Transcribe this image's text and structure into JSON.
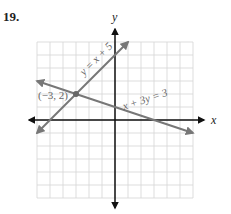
{
  "problem": {
    "number": "19."
  },
  "chart_data": {
    "type": "line",
    "title": "",
    "xlabel": "x",
    "ylabel": "y",
    "xlim": [
      -6,
      6
    ],
    "ylim": [
      -6,
      6
    ],
    "grid": true,
    "grid_step": 1,
    "series": [
      {
        "name": "y = x + 5",
        "equation": "y = x + 5",
        "x": [
          -6,
          1
        ],
        "y": [
          -1,
          6
        ],
        "color": "#777777"
      },
      {
        "name": "x + 3y = 3",
        "equation": "x + 3y = 3",
        "x": [
          -6,
          6
        ],
        "y": [
          3,
          -1
        ],
        "color": "#777777"
      }
    ],
    "annotations": [
      {
        "text": "(−3, 2)",
        "x": -3,
        "y": 2,
        "type": "intersection-point"
      }
    ]
  },
  "labels": {
    "x_axis": "x",
    "y_axis": "y",
    "line1": "y = x + 5",
    "line2": "x + 3y = 3",
    "point": "(−3, 2)"
  }
}
